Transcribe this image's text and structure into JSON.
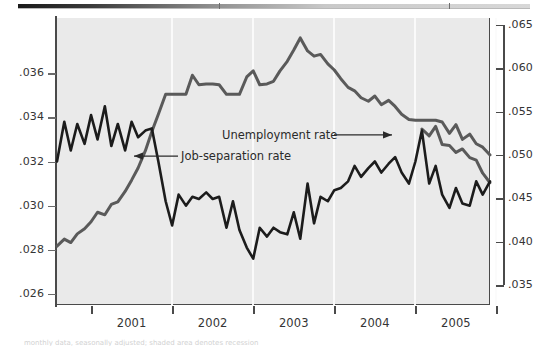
{
  "figure": {
    "top_rule": {
      "present": true,
      "gradient_from": "#1a1a1a",
      "gradient_to": "#d8d8d8"
    },
    "plot_bg_color": "#eaeaea",
    "caption_partial": "monthly data, seasonally adjusted; shaded area denotes recession"
  },
  "chart_data": {
    "type": "line",
    "title": "",
    "subtitle": "",
    "xlabel": "",
    "ylabel": "",
    "grid": true,
    "grid_orientation": "vertical",
    "legend": "inline-annotations",
    "x_axis": {
      "tick_labels": [
        "2001",
        "2002",
        "2003",
        "2004",
        "2005"
      ],
      "tick_boundaries": [
        2001,
        2002,
        2003,
        2004,
        2005,
        2006
      ],
      "range": [
        2000.58,
        2005.92
      ]
    },
    "y_axis_left": {
      "label_for": "Job-separation rate",
      "tick_labels": [
        ".036",
        ".034",
        ".032",
        ".030",
        ".028",
        ".026"
      ],
      "tick_values": [
        0.036,
        0.034,
        0.032,
        0.03,
        0.028,
        0.026
      ],
      "range": [
        0.0255,
        0.0385
      ]
    },
    "y_axis_right": {
      "label_for": "Unemployment rate",
      "tick_labels": [
        ".065",
        ".060",
        ".055",
        ".050",
        ".045",
        ".040",
        ".035"
      ],
      "tick_values": [
        0.065,
        0.06,
        0.055,
        0.05,
        0.045,
        0.04,
        0.035
      ],
      "range": [
        0.0327,
        0.0658
      ]
    },
    "annotations": [
      {
        "text": "Unemployment rate",
        "arrow": "right",
        "x": 2002.55,
        "y": 0.0522
      },
      {
        "text": "Job-separation rate",
        "arrow": "left",
        "x": 2001.3,
        "y": 0.0322
      }
    ],
    "series": [
      {
        "name": "Unemployment rate",
        "axis": "right",
        "color": "#5a5a5a",
        "x": [
          2000.58,
          2000.67,
          2000.75,
          2000.83,
          2000.92,
          2001.0,
          2001.08,
          2001.17,
          2001.25,
          2001.33,
          2001.42,
          2001.5,
          2001.58,
          2001.67,
          2001.75,
          2001.83,
          2001.92,
          2002.0,
          2002.08,
          2002.17,
          2002.25,
          2002.33,
          2002.42,
          2002.5,
          2002.58,
          2002.67,
          2002.75,
          2002.83,
          2002.92,
          2003.0,
          2003.08,
          2003.17,
          2003.25,
          2003.33,
          2003.42,
          2003.5,
          2003.58,
          2003.67,
          2003.75,
          2003.83,
          2003.92,
          2004.0,
          2004.08,
          2004.17,
          2004.25,
          2004.33,
          2004.42,
          2004.5,
          2004.58,
          2004.67,
          2004.75,
          2004.83,
          2004.92,
          2005.0,
          2005.08,
          2005.17,
          2005.25,
          2005.33,
          2005.42,
          2005.5,
          2005.58,
          2005.67,
          2005.75,
          2005.83,
          2005.92
        ],
        "y": [
          0.0395,
          0.0403,
          0.0399,
          0.0409,
          0.0415,
          0.0423,
          0.0434,
          0.0431,
          0.0443,
          0.0446,
          0.0458,
          0.0471,
          0.0485,
          0.0505,
          0.0527,
          0.0547,
          0.057,
          0.057,
          0.057,
          0.057,
          0.0592,
          0.0581,
          0.0582,
          0.0582,
          0.0581,
          0.057,
          0.057,
          0.057,
          0.059,
          0.0597,
          0.0581,
          0.0582,
          0.0585,
          0.0597,
          0.0608,
          0.0621,
          0.0635,
          0.062,
          0.0614,
          0.0616,
          0.0605,
          0.0598,
          0.0588,
          0.0578,
          0.0574,
          0.0566,
          0.0562,
          0.0568,
          0.0558,
          0.0563,
          0.0556,
          0.0547,
          0.0541,
          0.054,
          0.054,
          0.054,
          0.054,
          0.0538,
          0.0525,
          0.0535,
          0.0518,
          0.0524,
          0.0513,
          0.0509,
          0.05
        ],
        "y_tail_x": [
          2005.08,
          2005.17,
          2005.25,
          2005.33,
          2005.42,
          2005.5,
          2005.58,
          2005.67,
          2005.75,
          2005.83,
          2005.92
        ],
        "y_tail": [
          0.053,
          0.0522,
          0.0533,
          0.0512,
          0.0511,
          0.0503,
          0.0507,
          0.0497,
          0.0494,
          0.0479,
          0.0468
        ]
      },
      {
        "name": "Job-separation rate",
        "axis": "left",
        "color": "#1c1c1c",
        "x": [
          2000.58,
          2000.67,
          2000.75,
          2000.83,
          2000.92,
          2001.0,
          2001.08,
          2001.17,
          2001.25,
          2001.33,
          2001.42,
          2001.5,
          2001.58,
          2001.67,
          2001.75,
          2001.83,
          2001.92,
          2002.0,
          2002.08,
          2002.17,
          2002.25,
          2002.33,
          2002.42,
          2002.5,
          2002.58,
          2002.67,
          2002.75,
          2002.83,
          2002.92,
          2003.0,
          2003.08,
          2003.17,
          2003.25,
          2003.33,
          2003.42,
          2003.5,
          2003.58,
          2003.67,
          2003.75,
          2003.83,
          2003.92,
          2004.0,
          2004.08,
          2004.17,
          2004.25,
          2004.33,
          2004.42,
          2004.5,
          2004.58,
          2004.67,
          2004.75,
          2004.83,
          2004.92,
          2005.0,
          2005.08,
          2005.17,
          2005.25,
          2005.33,
          2005.42,
          2005.5,
          2005.58,
          2005.67,
          2005.75,
          2005.83,
          2005.92
        ],
        "y": [
          0.032,
          0.0338,
          0.0325,
          0.0337,
          0.0328,
          0.0341,
          0.033,
          0.0345,
          0.0327,
          0.0337,
          0.0325,
          0.0338,
          0.0331,
          0.0334,
          0.0335,
          0.032,
          0.0302,
          0.0291,
          0.0305,
          0.03,
          0.0304,
          0.0303,
          0.0306,
          0.0303,
          0.0304,
          0.029,
          0.0302,
          0.0289,
          0.0281,
          0.0276,
          0.029,
          0.0286,
          0.029,
          0.0288,
          0.0287,
          0.0297,
          0.0285,
          0.031,
          0.0292,
          0.0304,
          0.0302,
          0.0307,
          0.0308,
          0.0311,
          0.0318,
          0.0313,
          0.0317,
          0.032,
          0.0315,
          0.0319,
          0.0322,
          0.0315,
          0.031,
          0.032,
          0.0334,
          0.031,
          0.0318,
          0.0305,
          0.0299,
          0.0308,
          0.0301,
          0.03,
          0.0311,
          0.0305,
          0.0311
        ]
      }
    ]
  }
}
